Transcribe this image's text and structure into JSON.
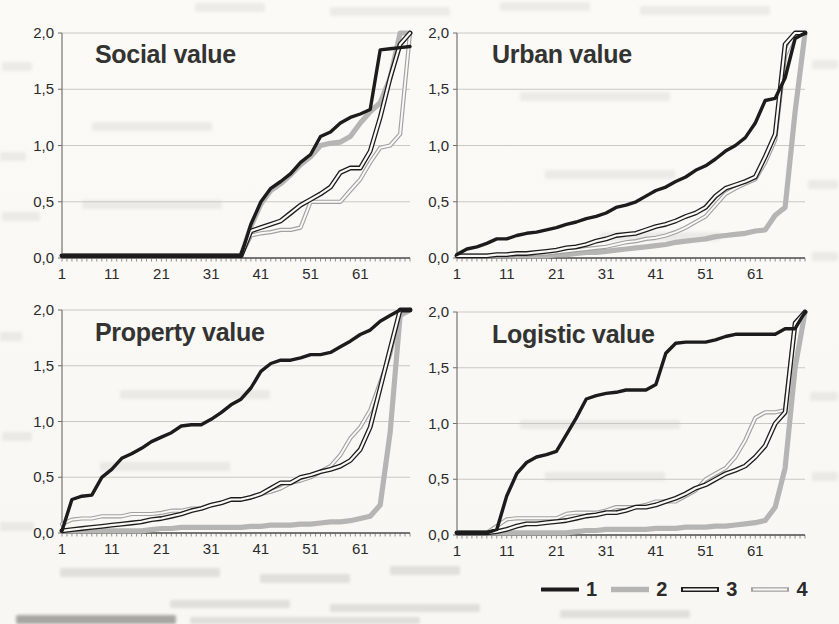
{
  "page": {
    "background_color": "#fbfaf7"
  },
  "legend": {
    "items": [
      {
        "label": "1",
        "style": "thick-black-line",
        "color": "#1c1c1c",
        "width": 3.4,
        "double": false,
        "core": 0
      },
      {
        "label": "2",
        "style": "thick-gray-line",
        "color": "#b5b5b3",
        "width": 5.2,
        "double": false,
        "core": 0
      },
      {
        "label": "3",
        "style": "double-black-line",
        "color": "#1c1c1c",
        "width": 4.8,
        "double": true,
        "core": 2.2
      },
      {
        "label": "4",
        "style": "double-gray-line",
        "color": "#a1a19f",
        "width": 4.2,
        "double": true,
        "core": 1.9
      }
    ]
  },
  "chart_data": [
    {
      "type": "line",
      "title": "Social value",
      "xlim": [
        1,
        71
      ],
      "ylim": [
        0,
        2
      ],
      "xticks": [
        1,
        11,
        21,
        31,
        41,
        51,
        61
      ],
      "yticks": [
        "0,0",
        "0,5",
        "1,0",
        "1,5",
        "2,0"
      ],
      "grid": "horizontal",
      "x": [
        1,
        3,
        5,
        7,
        9,
        11,
        13,
        15,
        17,
        19,
        21,
        23,
        25,
        27,
        29,
        31,
        33,
        35,
        37,
        39,
        41,
        43,
        45,
        47,
        49,
        51,
        53,
        55,
        57,
        59,
        61,
        63,
        65,
        67,
        69,
        71
      ],
      "series": [
        {
          "name": "1",
          "values": [
            0.02,
            0.02,
            0.02,
            0.02,
            0.02,
            0.02,
            0.02,
            0.02,
            0.02,
            0.02,
            0.02,
            0.02,
            0.02,
            0.02,
            0.02,
            0.02,
            0.02,
            0.02,
            0.02,
            0.3,
            0.5,
            0.62,
            0.68,
            0.75,
            0.85,
            0.92,
            1.08,
            1.12,
            1.2,
            1.25,
            1.28,
            1.32,
            1.85,
            1.86,
            1.87,
            1.88
          ]
        },
        {
          "name": "2",
          "values": [
            0.02,
            0.02,
            0.02,
            0.02,
            0.02,
            0.02,
            0.02,
            0.02,
            0.02,
            0.02,
            0.02,
            0.02,
            0.02,
            0.02,
            0.02,
            0.02,
            0.02,
            0.02,
            0.02,
            0.28,
            0.48,
            0.6,
            0.66,
            0.74,
            0.83,
            0.9,
            1.0,
            1.02,
            1.03,
            1.08,
            1.2,
            1.3,
            1.38,
            1.6,
            2.0,
            2.0
          ]
        },
        {
          "name": "3",
          "values": [
            0.02,
            0.02,
            0.02,
            0.02,
            0.02,
            0.02,
            0.02,
            0.02,
            0.02,
            0.02,
            0.02,
            0.02,
            0.02,
            0.02,
            0.02,
            0.02,
            0.02,
            0.02,
            0.02,
            0.24,
            0.27,
            0.3,
            0.33,
            0.4,
            0.47,
            0.52,
            0.57,
            0.63,
            0.76,
            0.8,
            0.8,
            0.95,
            1.25,
            1.6,
            1.9,
            2.0
          ]
        },
        {
          "name": "4",
          "values": [
            0.02,
            0.02,
            0.02,
            0.02,
            0.02,
            0.02,
            0.02,
            0.02,
            0.02,
            0.02,
            0.02,
            0.02,
            0.02,
            0.02,
            0.02,
            0.02,
            0.02,
            0.02,
            0.02,
            0.2,
            0.22,
            0.23,
            0.25,
            0.25,
            0.27,
            0.5,
            0.5,
            0.5,
            0.5,
            0.6,
            0.7,
            0.85,
            0.98,
            1.0,
            1.1,
            2.0
          ]
        }
      ]
    },
    {
      "type": "line",
      "title": "Urban value",
      "xlim": [
        1,
        71
      ],
      "ylim": [
        0,
        2
      ],
      "xticks": [
        1,
        11,
        21,
        31,
        41,
        51,
        61
      ],
      "yticks": [
        "0,0",
        "0,5",
        "1,0",
        "1,5",
        "2,0"
      ],
      "grid": "horizontal",
      "x": [
        1,
        3,
        5,
        7,
        9,
        11,
        13,
        15,
        17,
        19,
        21,
        23,
        25,
        27,
        29,
        31,
        33,
        35,
        37,
        39,
        41,
        43,
        45,
        47,
        49,
        51,
        53,
        55,
        57,
        59,
        61,
        63,
        65,
        67,
        69,
        71
      ],
      "series": [
        {
          "name": "1",
          "values": [
            0.03,
            0.08,
            0.1,
            0.13,
            0.17,
            0.17,
            0.2,
            0.22,
            0.23,
            0.25,
            0.27,
            0.3,
            0.32,
            0.35,
            0.37,
            0.4,
            0.45,
            0.47,
            0.5,
            0.55,
            0.6,
            0.63,
            0.68,
            0.72,
            0.78,
            0.82,
            0.88,
            0.95,
            1.0,
            1.07,
            1.2,
            1.4,
            1.42,
            1.6,
            1.95,
            2.0
          ]
        },
        {
          "name": "2",
          "values": [
            0.02,
            0.02,
            0.02,
            0.02,
            0.02,
            0.02,
            0.02,
            0.02,
            0.02,
            0.02,
            0.03,
            0.03,
            0.04,
            0.05,
            0.05,
            0.06,
            0.07,
            0.08,
            0.09,
            0.1,
            0.11,
            0.12,
            0.14,
            0.15,
            0.16,
            0.17,
            0.19,
            0.2,
            0.21,
            0.22,
            0.24,
            0.25,
            0.38,
            0.45,
            1.3,
            2.0
          ]
        },
        {
          "name": "3",
          "values": [
            0.02,
            0.02,
            0.02,
            0.02,
            0.03,
            0.03,
            0.04,
            0.04,
            0.05,
            0.06,
            0.07,
            0.09,
            0.1,
            0.12,
            0.15,
            0.17,
            0.2,
            0.21,
            0.22,
            0.25,
            0.28,
            0.3,
            0.33,
            0.37,
            0.4,
            0.45,
            0.55,
            0.62,
            0.65,
            0.68,
            0.72,
            0.9,
            1.1,
            1.9,
            2.0,
            2.0
          ]
        },
        {
          "name": "4",
          "values": [
            0.02,
            0.02,
            0.02,
            0.02,
            0.02,
            0.02,
            0.03,
            0.03,
            0.04,
            0.04,
            0.05,
            0.06,
            0.07,
            0.08,
            0.09,
            0.1,
            0.12,
            0.14,
            0.15,
            0.17,
            0.18,
            0.2,
            0.23,
            0.27,
            0.32,
            0.37,
            0.47,
            0.57,
            0.62,
            0.66,
            0.7,
            0.85,
            1.05,
            1.8,
            2.0,
            2.0
          ]
        }
      ]
    },
    {
      "type": "line",
      "title": "Property value",
      "xlim": [
        1,
        71
      ],
      "ylim": [
        0,
        2
      ],
      "xticks": [
        1,
        11,
        21,
        31,
        41,
        51,
        61
      ],
      "yticks": [
        "0,0",
        "0,5",
        "1,0",
        "1,5",
        "2,0"
      ],
      "grid": "horizontal",
      "x": [
        1,
        3,
        5,
        7,
        9,
        11,
        13,
        15,
        17,
        19,
        21,
        23,
        25,
        27,
        29,
        31,
        33,
        35,
        37,
        39,
        41,
        43,
        45,
        47,
        49,
        51,
        53,
        55,
        57,
        59,
        61,
        63,
        65,
        67,
        69,
        71
      ],
      "series": [
        {
          "name": "1",
          "values": [
            0.02,
            0.3,
            0.33,
            0.34,
            0.5,
            0.57,
            0.67,
            0.71,
            0.76,
            0.82,
            0.86,
            0.9,
            0.96,
            0.97,
            0.97,
            1.02,
            1.08,
            1.15,
            1.2,
            1.3,
            1.45,
            1.52,
            1.55,
            1.55,
            1.57,
            1.6,
            1.6,
            1.62,
            1.67,
            1.72,
            1.78,
            1.82,
            1.9,
            1.95,
            2.0,
            2.0
          ]
        },
        {
          "name": "2",
          "values": [
            0.02,
            0.02,
            0.02,
            0.02,
            0.02,
            0.02,
            0.02,
            0.02,
            0.02,
            0.03,
            0.04,
            0.04,
            0.05,
            0.05,
            0.05,
            0.05,
            0.05,
            0.05,
            0.05,
            0.06,
            0.06,
            0.07,
            0.07,
            0.07,
            0.08,
            0.08,
            0.09,
            0.1,
            0.1,
            0.11,
            0.13,
            0.15,
            0.25,
            0.9,
            1.95,
            2.0
          ]
        },
        {
          "name": "3",
          "values": [
            0.02,
            0.03,
            0.04,
            0.05,
            0.06,
            0.07,
            0.08,
            0.09,
            0.1,
            0.12,
            0.13,
            0.15,
            0.17,
            0.2,
            0.22,
            0.25,
            0.27,
            0.3,
            0.3,
            0.32,
            0.35,
            0.4,
            0.45,
            0.45,
            0.5,
            0.52,
            0.55,
            0.57,
            0.6,
            0.65,
            0.75,
            0.95,
            1.3,
            1.65,
            2.0,
            2.0
          ]
        },
        {
          "name": "4",
          "values": [
            0.08,
            0.12,
            0.13,
            0.13,
            0.15,
            0.15,
            0.15,
            0.17,
            0.17,
            0.17,
            0.18,
            0.2,
            0.2,
            0.22,
            0.22,
            0.25,
            0.27,
            0.3,
            0.3,
            0.32,
            0.35,
            0.37,
            0.4,
            0.45,
            0.47,
            0.5,
            0.55,
            0.6,
            0.7,
            0.85,
            0.95,
            1.1,
            1.35,
            1.6,
            2.0,
            2.0
          ]
        }
      ]
    },
    {
      "type": "line",
      "title": "Logistic value",
      "xlim": [
        1,
        71
      ],
      "ylim": [
        0,
        2
      ],
      "xticks": [
        1,
        11,
        21,
        31,
        41,
        51,
        61
      ],
      "yticks": [
        "0,0",
        "0,5",
        "1,0",
        "1,5",
        "2,0"
      ],
      "grid": "horizontal",
      "x": [
        1,
        3,
        5,
        7,
        9,
        11,
        13,
        15,
        17,
        19,
        21,
        23,
        25,
        27,
        29,
        31,
        33,
        35,
        37,
        39,
        41,
        43,
        45,
        47,
        49,
        51,
        53,
        55,
        57,
        59,
        61,
        63,
        65,
        67,
        69,
        71
      ],
      "series": [
        {
          "name": "1",
          "values": [
            0.02,
            0.02,
            0.02,
            0.02,
            0.05,
            0.35,
            0.55,
            0.65,
            0.7,
            0.72,
            0.75,
            0.9,
            1.05,
            1.22,
            1.25,
            1.27,
            1.28,
            1.3,
            1.3,
            1.3,
            1.35,
            1.63,
            1.72,
            1.73,
            1.73,
            1.73,
            1.75,
            1.78,
            1.8,
            1.8,
            1.8,
            1.8,
            1.8,
            1.85,
            1.85,
            2.0
          ]
        },
        {
          "name": "2",
          "values": [
            0.02,
            0.02,
            0.02,
            0.02,
            0.02,
            0.02,
            0.02,
            0.02,
            0.02,
            0.02,
            0.02,
            0.02,
            0.03,
            0.04,
            0.04,
            0.05,
            0.05,
            0.05,
            0.05,
            0.05,
            0.06,
            0.06,
            0.06,
            0.07,
            0.07,
            0.07,
            0.08,
            0.08,
            0.09,
            0.1,
            0.11,
            0.13,
            0.25,
            0.6,
            1.5,
            2.0
          ]
        },
        {
          "name": "3",
          "values": [
            0.02,
            0.02,
            0.02,
            0.02,
            0.03,
            0.05,
            0.08,
            0.1,
            0.1,
            0.11,
            0.12,
            0.13,
            0.15,
            0.17,
            0.18,
            0.2,
            0.2,
            0.22,
            0.25,
            0.25,
            0.27,
            0.3,
            0.33,
            0.37,
            0.42,
            0.45,
            0.5,
            0.55,
            0.58,
            0.62,
            0.7,
            0.8,
            1.0,
            1.1,
            1.9,
            2.0
          ]
        },
        {
          "name": "4",
          "values": [
            0.02,
            0.02,
            0.02,
            0.02,
            0.08,
            0.14,
            0.15,
            0.15,
            0.15,
            0.15,
            0.15,
            0.19,
            0.2,
            0.2,
            0.2,
            0.22,
            0.25,
            0.25,
            0.25,
            0.27,
            0.3,
            0.3,
            0.3,
            0.35,
            0.4,
            0.5,
            0.55,
            0.6,
            0.7,
            0.85,
            1.05,
            1.1,
            1.1,
            1.12,
            1.9,
            2.0
          ]
        }
      ]
    }
  ]
}
